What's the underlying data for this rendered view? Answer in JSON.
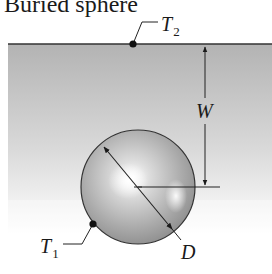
{
  "figure": {
    "title": "Buried sphere",
    "labels": {
      "surface_temperature": {
        "symbol": "T",
        "subscript": "2"
      },
      "sphere_temperature": {
        "symbol": "T",
        "subscript": "1"
      },
      "depth": "W",
      "diameter": "D"
    },
    "colors": {
      "ground_top": "#b4b4b4",
      "ground_bottom": "#ffffff",
      "sphere_light": "#ffffff",
      "sphere_mid": "#bdbdbd",
      "sphere_dark": "#8a8a8a",
      "line": "#222222"
    }
  }
}
